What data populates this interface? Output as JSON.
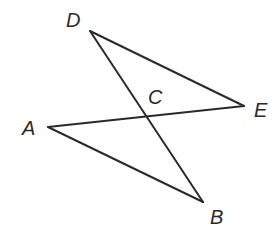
{
  "diagram": {
    "type": "geometry",
    "points": {
      "D": {
        "label": "D",
        "x": 90,
        "y": 31,
        "label_x": 66,
        "label_y": 27
      },
      "E": {
        "label": "E",
        "x": 244,
        "y": 106,
        "label_x": 254,
        "label_y": 117
      },
      "A": {
        "label": "A",
        "x": 48,
        "y": 127,
        "label_x": 22,
        "label_y": 135
      },
      "B": {
        "label": "B",
        "x": 203,
        "y": 202,
        "label_x": 210,
        "label_y": 224
      },
      "C": {
        "label": "C",
        "x": 147,
        "y": 117,
        "label_x": 148,
        "label_y": 104
      }
    },
    "segments": [
      {
        "from": "D",
        "to": "E"
      },
      {
        "from": "D",
        "to": "B"
      },
      {
        "from": "A",
        "to": "E"
      },
      {
        "from": "A",
        "to": "B"
      }
    ],
    "stroke_color": "#2a2a2a",
    "background": "#ffffff"
  }
}
